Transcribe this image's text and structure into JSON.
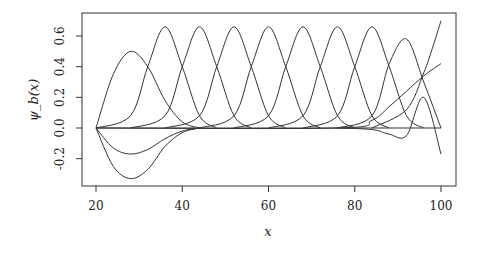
{
  "chart_data": {
    "type": "line",
    "title": "",
    "xlabel": "x",
    "ylabel": "ψ_b(x)",
    "xlim": [
      17,
      103
    ],
    "ylim": [
      -0.38,
      0.75
    ],
    "x_ticks": [
      20,
      40,
      60,
      80,
      100
    ],
    "x_tick_labels": [
      "20",
      "40",
      "60",
      "80",
      "100"
    ],
    "y_ticks": [
      -0.2,
      0.0,
      0.2,
      0.4,
      0.6
    ],
    "y_tick_labels": [
      "-0.2",
      "0.0",
      "0.2",
      "0.4",
      "0.6"
    ],
    "grid": false,
    "legend": null,
    "series": [
      {
        "name": "b1",
        "x": [
          20,
          24,
          28,
          32,
          36,
          40,
          44
        ],
        "values": [
          0,
          0.35,
          0.5,
          0.4,
          0.18,
          0.04,
          0
        ]
      },
      {
        "name": "b2",
        "x": [
          20,
          28,
          32,
          36,
          40,
          44,
          48
        ],
        "values": [
          0,
          0.08,
          0.4,
          0.66,
          0.4,
          0.08,
          0
        ]
      },
      {
        "name": "b3",
        "x": [
          28,
          36,
          40,
          44,
          48,
          52,
          56
        ],
        "values": [
          0,
          0.08,
          0.4,
          0.66,
          0.4,
          0.08,
          0
        ]
      },
      {
        "name": "b4",
        "x": [
          36,
          44,
          48,
          52,
          56,
          60,
          64
        ],
        "values": [
          0,
          0.08,
          0.4,
          0.66,
          0.4,
          0.08,
          0
        ]
      },
      {
        "name": "b5",
        "x": [
          44,
          52,
          56,
          60,
          64,
          68,
          72
        ],
        "values": [
          0,
          0.08,
          0.4,
          0.66,
          0.4,
          0.08,
          0
        ]
      },
      {
        "name": "b6",
        "x": [
          52,
          60,
          64,
          68,
          72,
          76,
          80
        ],
        "values": [
          0,
          0.08,
          0.4,
          0.66,
          0.4,
          0.08,
          0
        ]
      },
      {
        "name": "b7",
        "x": [
          60,
          68,
          72,
          76,
          80,
          84,
          88
        ],
        "values": [
          0,
          0.08,
          0.4,
          0.66,
          0.4,
          0.08,
          0
        ]
      },
      {
        "name": "b8",
        "x": [
          68,
          76,
          80,
          84,
          88,
          92,
          96
        ],
        "values": [
          0,
          0.08,
          0.4,
          0.66,
          0.4,
          0.08,
          0
        ]
      },
      {
        "name": "b9",
        "x": [
          76,
          84,
          88,
          92,
          96,
          100
        ],
        "values": [
          0,
          0.08,
          0.42,
          0.58,
          0.3,
          0
        ]
      },
      {
        "name": "b10",
        "x": [
          76,
          84,
          88,
          92,
          96,
          100
        ],
        "values": [
          0,
          -0.01,
          -0.04,
          -0.05,
          0.2,
          -0.17
        ]
      },
      {
        "name": "b11",
        "x": [
          20,
          76,
          84,
          88,
          92,
          96,
          100
        ],
        "values": [
          0,
          0,
          0.05,
          0.14,
          0.24,
          0.34,
          0.42
        ]
      },
      {
        "name": "b12",
        "x": [
          84,
          92,
          96,
          98,
          100
        ],
        "values": [
          0,
          0.12,
          0.36,
          0.52,
          0.7
        ]
      },
      {
        "name": "neg1",
        "x": [
          20,
          24,
          28,
          32,
          36,
          40,
          44
        ],
        "values": [
          0,
          -0.13,
          -0.17,
          -0.14,
          -0.07,
          -0.02,
          0
        ]
      },
      {
        "name": "neg2",
        "x": [
          20,
          24,
          28,
          32,
          36,
          40,
          44
        ],
        "values": [
          0,
          -0.25,
          -0.33,
          -0.27,
          -0.12,
          -0.03,
          0
        ]
      }
    ]
  }
}
